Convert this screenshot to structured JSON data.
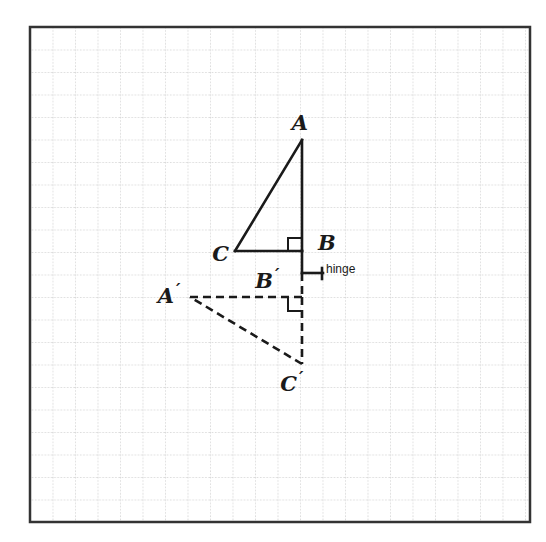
{
  "figure": {
    "background_color": "#ffffff",
    "grid": {
      "x": 30,
      "y": 27,
      "width": 500,
      "height": 495,
      "cell": 22.5,
      "line_color": "#b8b8b8",
      "border_color": "#333333",
      "border_width": 2.5,
      "dotted": true
    },
    "stroke_color": "#1a1a1a",
    "solid_width": 2.6,
    "dash_pattern": "8,5"
  },
  "shapes": {
    "original_triangle": {
      "name": "triangle-ABC",
      "style": "solid",
      "vertices": [
        {
          "label": "A",
          "x": 302,
          "y": 140
        },
        {
          "label": "B",
          "x": 302,
          "y": 251
        },
        {
          "label": "C",
          "x": 235,
          "y": 251
        }
      ],
      "right_angle_at": "B"
    },
    "image_triangle": {
      "name": "triangle-A-prime-B-prime-C-prime",
      "style": "dashed",
      "vertices": [
        {
          "label": "A'",
          "x": 190,
          "y": 297
        },
        {
          "label": "B'",
          "x": 302,
          "y": 297
        },
        {
          "label": "C'",
          "x": 302,
          "y": 364
        }
      ],
      "right_angle_at": "B'"
    },
    "hinge": {
      "name": "hinge-segment",
      "style": "solid",
      "x1": 302,
      "y1": 273,
      "x2": 323,
      "y2": 273,
      "tick_height": 9
    },
    "connector": {
      "name": "hinge-connector",
      "style": "solid",
      "x1": 302,
      "y1": 251,
      "x2": 302,
      "y2": 273
    }
  },
  "labels": {
    "A": {
      "text": "A",
      "x": 300,
      "y": 130,
      "anchor": "middle"
    },
    "B": {
      "text": "B",
      "x": 318,
      "y": 250,
      "anchor": "start"
    },
    "C": {
      "text": "C",
      "x": 229,
      "y": 261,
      "anchor": "end"
    },
    "A_prime": {
      "text": "A",
      "prime": "′",
      "x": 174,
      "y": 303,
      "anchor": "end"
    },
    "B_prime": {
      "text": "B",
      "prime": "′",
      "x": 273,
      "y": 288,
      "anchor": "end"
    },
    "C_prime": {
      "text": "C",
      "prime": "′",
      "x": 297,
      "y": 391,
      "anchor": "end"
    },
    "hinge": {
      "text": "hinge",
      "x": 326,
      "y": 273,
      "anchor": "start"
    }
  }
}
